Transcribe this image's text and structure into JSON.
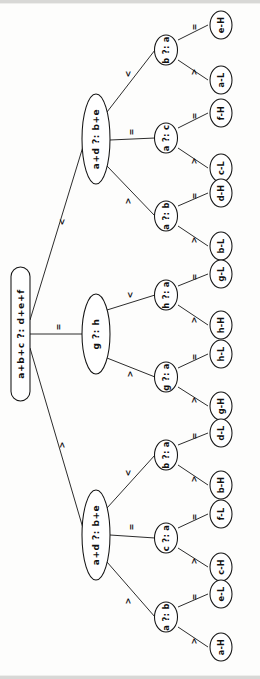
{
  "diagram": {
    "kind": "decision-tree",
    "orientation": "rotated-90-ccw",
    "title_text": "",
    "edge_labels": {
      "less": "<",
      "equal": "=",
      "greater": ">"
    },
    "colors": {
      "stroke": "#141414",
      "node_fill": "#ffffff",
      "page": "#fdfdfc",
      "text": "#111111"
    },
    "root": {
      "label": "a+b+c ?: d+e+f"
    },
    "branches": [
      {
        "id": "branch-top",
        "label": "a+d ?: b+e",
        "edge_from_root": "<"
      },
      {
        "id": "branch-middle",
        "label": "g ?: h",
        "edge_from_root": "="
      },
      {
        "id": "branch-bottom",
        "label": "a+d ?: b+e",
        "edge_from_root": ">"
      }
    ],
    "inner_nodes": [
      {
        "id": "n1",
        "label": "b ?: a",
        "parent": "branch-top",
        "edge_from_parent": "<"
      },
      {
        "id": "n2",
        "label": "a ?: c",
        "parent": "branch-top",
        "edge_from_parent": "="
      },
      {
        "id": "n3",
        "label": "a ?: b",
        "parent": "branch-top",
        "edge_from_parent": ">"
      },
      {
        "id": "n4",
        "label": "h ?: a",
        "parent": "branch-middle",
        "edge_from_parent": "<"
      },
      {
        "id": "n5",
        "label": "g ?: a",
        "parent": "branch-middle",
        "edge_from_parent": ">"
      },
      {
        "id": "n6",
        "label": "b ?: a",
        "parent": "branch-bottom",
        "edge_from_parent": "<"
      },
      {
        "id": "n7",
        "label": "c ?: a",
        "parent": "branch-bottom",
        "edge_from_parent": "="
      },
      {
        "id": "n8",
        "label": "a ?: b",
        "parent": "branch-bottom",
        "edge_from_parent": ">"
      }
    ],
    "leaves": [
      {
        "id": "L1",
        "label": "e-H",
        "parent": "n1",
        "edge_from_parent": "="
      },
      {
        "id": "L2",
        "label": "a-L",
        "parent": "n1",
        "edge_from_parent": ">"
      },
      {
        "id": "L3",
        "label": "f-H",
        "parent": "n2",
        "edge_from_parent": "="
      },
      {
        "id": "L4",
        "label": "c-L",
        "parent": "n2",
        "edge_from_parent": ">"
      },
      {
        "id": "L5",
        "label": "d-H",
        "parent": "n3",
        "edge_from_parent": "="
      },
      {
        "id": "L6",
        "label": "b-L",
        "parent": "n3",
        "edge_from_parent": ">"
      },
      {
        "id": "L7",
        "label": "g-L",
        "parent": "n4",
        "edge_from_parent": "="
      },
      {
        "id": "L8",
        "label": "h-H",
        "parent": "n4",
        "edge_from_parent": ">"
      },
      {
        "id": "L9",
        "label": "h-L",
        "parent": "n5",
        "edge_from_parent": "="
      },
      {
        "id": "L10",
        "label": "g-H",
        "parent": "n5",
        "edge_from_parent": ">"
      },
      {
        "id": "L11",
        "label": "d-L",
        "parent": "n6",
        "edge_from_parent": "="
      },
      {
        "id": "L12",
        "label": "b-H",
        "parent": "n6",
        "edge_from_parent": ">"
      },
      {
        "id": "L13",
        "label": "f-L",
        "parent": "n7",
        "edge_from_parent": "="
      },
      {
        "id": "L14",
        "label": "c-H",
        "parent": "n7",
        "edge_from_parent": ">"
      },
      {
        "id": "L15",
        "label": "e-L",
        "parent": "n8",
        "edge_from_parent": "="
      },
      {
        "id": "L16",
        "label": "a-H",
        "parent": "n8",
        "edge_from_parent": ">"
      }
    ]
  }
}
